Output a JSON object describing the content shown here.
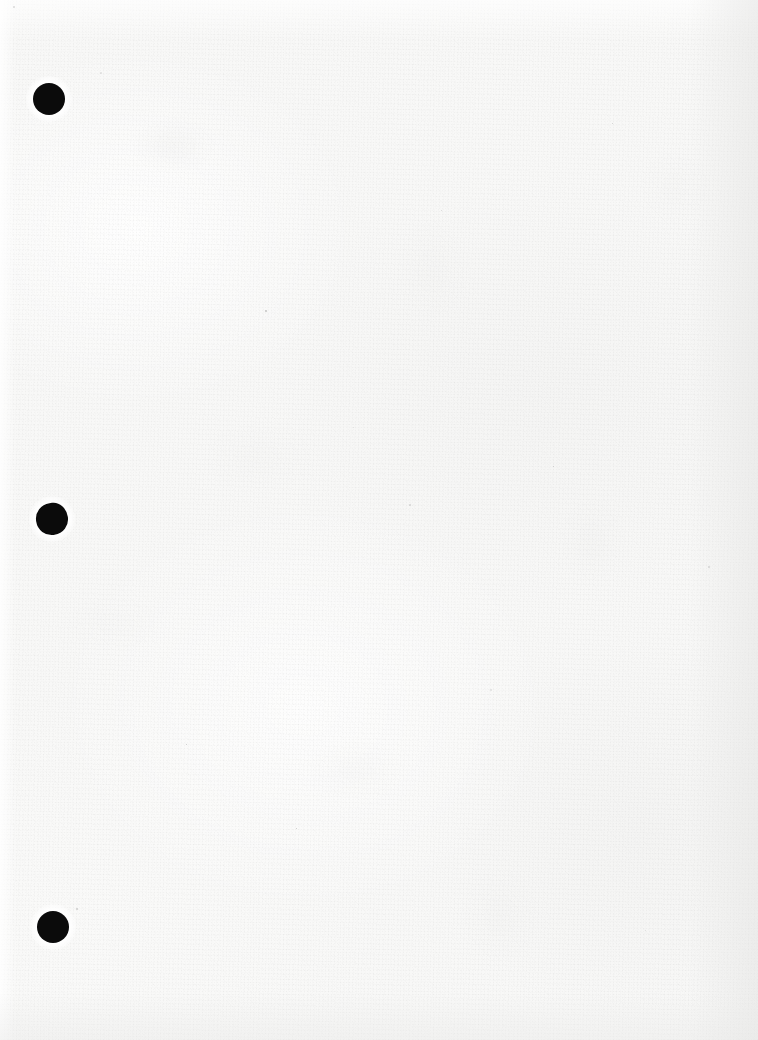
{
  "document": {
    "title": "Scanned blank page",
    "page_type": "blank-verso",
    "content_text": "",
    "width": 758,
    "height": 1040
  },
  "appearance": {
    "paper_color": "#f8f8f7",
    "mark_color": "#0b0b0b",
    "edge_shadow_color": "#e4e4e3",
    "texture": "paper-grain"
  },
  "marks": {
    "label": "hole-punch marks",
    "count": 3,
    "items": [
      {
        "name": "punch-mark-top",
        "x": 33,
        "y": 83,
        "size": 32,
        "shape": "circle",
        "notched": false
      },
      {
        "name": "punch-mark-middle",
        "x": 36,
        "y": 503,
        "size": 32,
        "shape": "notched",
        "notched": true
      },
      {
        "name": "punch-mark-bottom",
        "x": 37,
        "y": 911,
        "size": 32,
        "shape": "circle",
        "notched": false
      }
    ]
  },
  "specks": {
    "label": "scan debris specks",
    "items": [
      {
        "x": 100,
        "y": 72,
        "size": 2
      },
      {
        "x": 13,
        "y": 6,
        "size": 2
      },
      {
        "x": 76,
        "y": 908,
        "size": 2
      },
      {
        "x": 265,
        "y": 310,
        "size": 2
      },
      {
        "x": 353,
        "y": 427,
        "size": 1
      },
      {
        "x": 409,
        "y": 504,
        "size": 2
      },
      {
        "x": 553,
        "y": 466,
        "size": 1
      },
      {
        "x": 296,
        "y": 828,
        "size": 1
      },
      {
        "x": 490,
        "y": 689,
        "size": 2
      },
      {
        "x": 708,
        "y": 566,
        "size": 2
      },
      {
        "x": 612,
        "y": 123,
        "size": 1
      },
      {
        "x": 186,
        "y": 744,
        "size": 1
      },
      {
        "x": 645,
        "y": 930,
        "size": 1
      },
      {
        "x": 441,
        "y": 210,
        "size": 1
      }
    ]
  }
}
